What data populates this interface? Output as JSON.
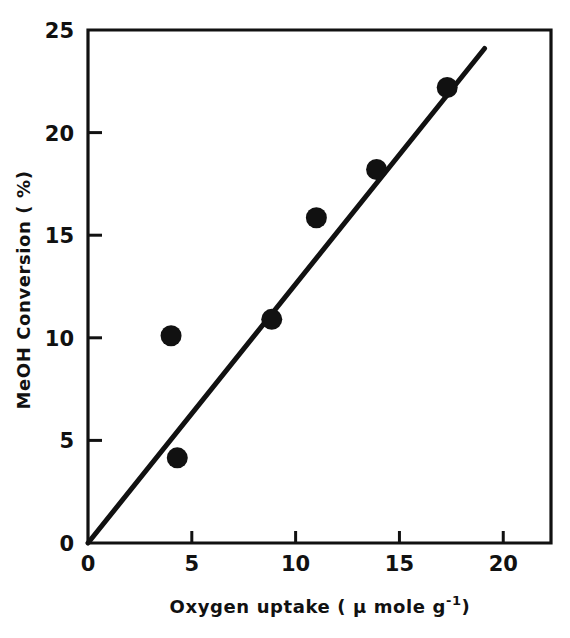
{
  "chart_data": {
    "type": "scatter",
    "title": "",
    "xlabel": "Oxygen uptake ( μ mole g",
    "xlabel_exponent": "-1",
    "xlabel_tail": ")",
    "ylabel": "MeOH Conversion ( %)",
    "xlim": [
      0,
      22.3
    ],
    "ylim": [
      0,
      25
    ],
    "grid": false,
    "legend": "none",
    "xticks": [
      0,
      5,
      10,
      15,
      20
    ],
    "xtick_labels": [
      "0",
      "5",
      "10",
      "15",
      "20"
    ],
    "yticks": [
      0,
      5,
      10,
      15,
      20,
      25
    ],
    "ytick_labels": [
      "0",
      "5",
      "10",
      "15",
      "20",
      "25"
    ],
    "series": [
      {
        "name": "MeOH conversion vs oxygen uptake",
        "marker": "filled-circle",
        "color": "#111111",
        "points": [
          {
            "x": 4.0,
            "y": 10.1
          },
          {
            "x": 4.3,
            "y": 4.15
          },
          {
            "x": 8.85,
            "y": 10.9
          },
          {
            "x": 11.0,
            "y": 15.85
          },
          {
            "x": 13.9,
            "y": 18.2
          },
          {
            "x": 17.3,
            "y": 22.2
          }
        ]
      },
      {
        "name": "fitted line",
        "marker": "line",
        "color": "#111111",
        "line_from": {
          "x": 0,
          "y": 0
        },
        "line_to": {
          "x": 19.1,
          "y": 24.1
        }
      }
    ]
  }
}
